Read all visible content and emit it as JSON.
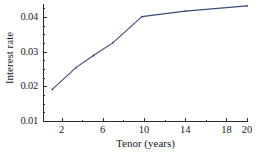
{
  "chart_data": {
    "type": "line",
    "title": "",
    "xlabel": "Tenor (years)",
    "ylabel": "Interest rate",
    "xlim": [
      1,
      20
    ],
    "ylim": [
      0.01,
      0.0445
    ],
    "grid": false,
    "legend": null,
    "xticks": [
      2,
      6,
      10,
      14,
      18,
      20
    ],
    "xtick_labels": [
      "2",
      "6",
      "10",
      "14",
      "18",
      "20"
    ],
    "yticks": [
      0.01,
      0.02,
      0.03,
      0.04
    ],
    "ytick_labels": [
      "0.01",
      "0.02",
      "0.03",
      "0.04"
    ],
    "y_minor_ticks": [
      0.0125,
      0.015,
      0.0175,
      0.0225,
      0.025,
      0.0275,
      0.0325,
      0.035,
      0.0375,
      0.0425
    ],
    "x_minor_ticks": [
      4,
      8,
      12,
      16
    ],
    "line_color": "#3b4a7a",
    "marker_color": "#3b4a7a",
    "series": [
      {
        "name": "Interest rate curve",
        "x": [
          1.1,
          3.4,
          5.1,
          7.0,
          9.8,
          14.0,
          20.0
        ],
        "values": [
          0.0191,
          0.0254,
          0.0289,
          0.0326,
          0.0401,
          0.0417,
          0.0432
        ]
      }
    ]
  },
  "axes": {
    "x_title": "Tenor (years)",
    "y_title": "Interest rate"
  }
}
